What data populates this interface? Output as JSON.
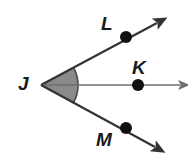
{
  "figure": {
    "kind": "geometry-angle-diagram",
    "background_color": "#ffffff",
    "labels": {
      "vertex": "J",
      "upper_point": "L",
      "middle_point": "K",
      "lower_point": "M"
    },
    "colors": {
      "ray_dark": "#333333",
      "ray_gray": "#6e6e6e",
      "shaded_wedge_fill": "#8a8a8a",
      "shaded_wedge_arc": "#4a4a4a",
      "point_dot": "#111111",
      "label_text": "#1a1a1a"
    },
    "geometry": {
      "vertex": {
        "x": 41,
        "y": 85
      },
      "rays": [
        {
          "name": "ray-JL",
          "to_x": 157,
          "to_y": 23,
          "stroke": "#333333",
          "width": 2.2
        },
        {
          "name": "ray-JK",
          "to_x": 180,
          "to_y": 85,
          "stroke": "#6e6e6e",
          "width": 1.6
        },
        {
          "name": "ray-JM",
          "to_x": 155,
          "to_y": 147,
          "stroke": "#333333",
          "width": 2.2
        }
      ],
      "points": [
        {
          "name": "point-L",
          "x": 126,
          "y": 37,
          "r": 6.0
        },
        {
          "name": "point-K",
          "x": 138,
          "y": 85,
          "r": 6.0
        },
        {
          "name": "point-M",
          "x": 126,
          "y": 128,
          "r": 6.0
        }
      ],
      "shaded_angle": {
        "name": "angle-LJM",
        "from_ray": "ray-JL",
        "to_ray": "ray-JM",
        "radius": 37
      }
    }
  }
}
